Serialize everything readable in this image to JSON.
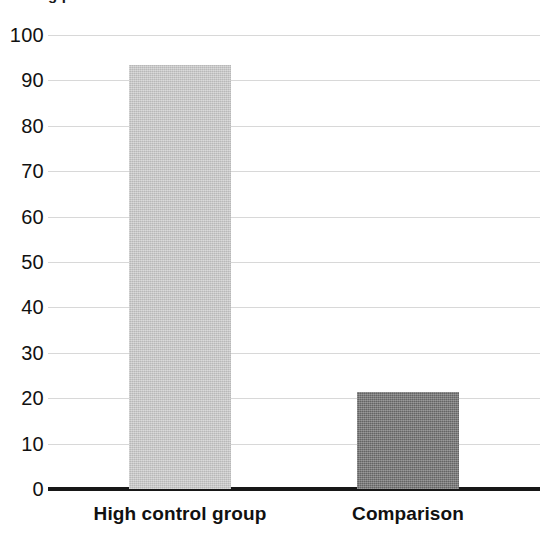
{
  "chart_data": {
    "type": "bar",
    "title": "",
    "title_clipped_fragment": "g  p",
    "categories": [
      "High control group",
      "Comparison"
    ],
    "values": [
      93.3,
      21.3
    ],
    "series": [
      {
        "name": "percent",
        "values": [
          93.3,
          21.3
        ]
      }
    ],
    "xlabel": "",
    "ylabel": "",
    "ylim": [
      0,
      100
    ],
    "ytick_labels": [
      "100",
      "90",
      "80",
      "70",
      "60",
      "50",
      "40",
      "30",
      "20",
      "10",
      "0"
    ],
    "ytick_values": [
      100,
      90,
      80,
      70,
      60,
      50,
      40,
      30,
      20,
      10,
      0
    ],
    "grid": true,
    "grid_axis": "y",
    "legend": false,
    "legend_position": "none",
    "bar_colors": [
      "#cbcbcb",
      "#6e6e6e"
    ],
    "grid_color": "#d8d8d8",
    "axis_color": "#171717",
    "background_color": "#ffffff",
    "text_color": "#111111"
  }
}
